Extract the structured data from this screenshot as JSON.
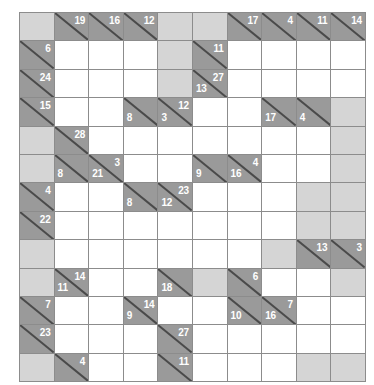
{
  "puzzle": {
    "type": "kakuro",
    "rows": 13,
    "cols": 10,
    "colors": {
      "white_cell": "#ffffff",
      "blocked_cell": "#d5d5d5",
      "clue_cell": "#9a9a9a",
      "grid_line": "#8c8c8c",
      "diagonal_line": "#4a4a4a",
      "clue_text": "#ffffff",
      "page_background": "#ffffff"
    },
    "legend": {
      "across_position": "upper-right",
      "down_position": "lower-left"
    },
    "grid": [
      [
        {
          "kind": "block"
        },
        {
          "kind": "clue",
          "across": "19"
        },
        {
          "kind": "clue",
          "across": "16"
        },
        {
          "kind": "clue",
          "across": "12"
        },
        {
          "kind": "block"
        },
        {
          "kind": "block"
        },
        {
          "kind": "clue",
          "across": "17"
        },
        {
          "kind": "clue",
          "across": "4"
        },
        {
          "kind": "clue",
          "across": "11"
        },
        {
          "kind": "clue",
          "across": "14"
        }
      ],
      [
        {
          "kind": "clue",
          "across": "6"
        },
        {
          "kind": "white"
        },
        {
          "kind": "white"
        },
        {
          "kind": "white"
        },
        {
          "kind": "block"
        },
        {
          "kind": "clue",
          "across": "11"
        },
        {
          "kind": "white"
        },
        {
          "kind": "white"
        },
        {
          "kind": "white"
        },
        {
          "kind": "white"
        }
      ],
      [
        {
          "kind": "clue",
          "across": "24"
        },
        {
          "kind": "white"
        },
        {
          "kind": "white"
        },
        {
          "kind": "white"
        },
        {
          "kind": "block"
        },
        {
          "kind": "clue",
          "across": "27",
          "down": "13"
        },
        {
          "kind": "white"
        },
        {
          "kind": "white"
        },
        {
          "kind": "white"
        },
        {
          "kind": "white"
        }
      ],
      [
        {
          "kind": "clue",
          "across": "15"
        },
        {
          "kind": "white"
        },
        {
          "kind": "white"
        },
        {
          "kind": "clue",
          "down": "8"
        },
        {
          "kind": "clue",
          "across": "12",
          "down": "3"
        },
        {
          "kind": "white"
        },
        {
          "kind": "white"
        },
        {
          "kind": "clue",
          "down": "17"
        },
        {
          "kind": "clue",
          "down": "4"
        },
        {
          "kind": "block"
        }
      ],
      [
        {
          "kind": "block"
        },
        {
          "kind": "clue",
          "across": "28"
        },
        {
          "kind": "white"
        },
        {
          "kind": "white"
        },
        {
          "kind": "white"
        },
        {
          "kind": "white"
        },
        {
          "kind": "white"
        },
        {
          "kind": "white"
        },
        {
          "kind": "white"
        },
        {
          "kind": "block"
        }
      ],
      [
        {
          "kind": "block"
        },
        {
          "kind": "clue",
          "down": "8"
        },
        {
          "kind": "clue",
          "across": "3",
          "down": "21"
        },
        {
          "kind": "white"
        },
        {
          "kind": "white"
        },
        {
          "kind": "clue",
          "down": "9"
        },
        {
          "kind": "clue",
          "across": "4",
          "down": "16"
        },
        {
          "kind": "white"
        },
        {
          "kind": "white"
        },
        {
          "kind": "block"
        }
      ],
      [
        {
          "kind": "clue",
          "across": "4"
        },
        {
          "kind": "white"
        },
        {
          "kind": "white"
        },
        {
          "kind": "clue",
          "down": "8"
        },
        {
          "kind": "clue",
          "across": "23",
          "down": "12"
        },
        {
          "kind": "white"
        },
        {
          "kind": "white"
        },
        {
          "kind": "white"
        },
        {
          "kind": "block"
        },
        {
          "kind": "block"
        }
      ],
      [
        {
          "kind": "clue",
          "across": "22"
        },
        {
          "kind": "white"
        },
        {
          "kind": "white"
        },
        {
          "kind": "white"
        },
        {
          "kind": "white"
        },
        {
          "kind": "white"
        },
        {
          "kind": "white"
        },
        {
          "kind": "white"
        },
        {
          "kind": "block"
        },
        {
          "kind": "block"
        }
      ],
      [
        {
          "kind": "block"
        },
        {
          "kind": "white"
        },
        {
          "kind": "white"
        },
        {
          "kind": "white"
        },
        {
          "kind": "white"
        },
        {
          "kind": "white"
        },
        {
          "kind": "white"
        },
        {
          "kind": "block"
        },
        {
          "kind": "clue",
          "across": "13"
        },
        {
          "kind": "clue",
          "across": "3"
        }
      ],
      [
        {
          "kind": "block"
        },
        {
          "kind": "clue",
          "across": "14",
          "down": "11"
        },
        {
          "kind": "white"
        },
        {
          "kind": "white"
        },
        {
          "kind": "clue",
          "down": "18"
        },
        {
          "kind": "block"
        },
        {
          "kind": "clue",
          "across": "6"
        },
        {
          "kind": "white"
        },
        {
          "kind": "white"
        },
        {
          "kind": "block"
        }
      ],
      [
        {
          "kind": "clue",
          "across": "7"
        },
        {
          "kind": "white"
        },
        {
          "kind": "white"
        },
        {
          "kind": "clue",
          "across": "14",
          "down": "9"
        },
        {
          "kind": "white"
        },
        {
          "kind": "white"
        },
        {
          "kind": "clue",
          "down": "10"
        },
        {
          "kind": "clue",
          "across": "7",
          "down": "16"
        },
        {
          "kind": "white"
        },
        {
          "kind": "white"
        }
      ],
      [
        {
          "kind": "clue",
          "across": "23"
        },
        {
          "kind": "white"
        },
        {
          "kind": "white"
        },
        {
          "kind": "white"
        },
        {
          "kind": "clue",
          "across": "27"
        },
        {
          "kind": "white"
        },
        {
          "kind": "white"
        },
        {
          "kind": "white"
        },
        {
          "kind": "white"
        },
        {
          "kind": "white"
        }
      ],
      [
        {
          "kind": "block"
        },
        {
          "kind": "clue",
          "across": "4"
        },
        {
          "kind": "white"
        },
        {
          "kind": "white"
        },
        {
          "kind": "clue",
          "across": "11"
        },
        {
          "kind": "white"
        },
        {
          "kind": "white"
        },
        {
          "kind": "white"
        },
        {
          "kind": "block"
        },
        {
          "kind": "block"
        }
      ]
    ]
  }
}
